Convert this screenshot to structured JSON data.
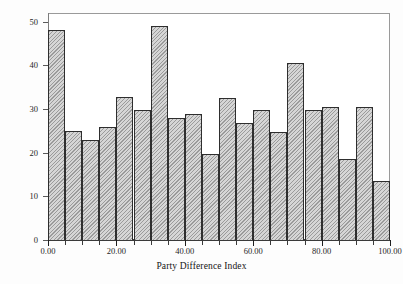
{
  "chart_data": {
    "type": "bar",
    "title": "",
    "subtitle": "",
    "xlabel": "Party Difference Index",
    "ylabel": "",
    "xlim": [
      0,
      100
    ],
    "ylim": [
      0,
      52
    ],
    "grid": false,
    "legend": null,
    "bin_width": 5,
    "x_ticks": [
      0,
      20,
      40,
      60,
      80,
      100
    ],
    "x_tick_labels": [
      "0.00",
      "20.00",
      "40.00",
      "60.00",
      "80.00",
      "100.00"
    ],
    "x_minor_ticks": [
      5,
      10,
      15,
      25,
      30,
      35,
      45,
      50,
      55,
      65,
      70,
      75,
      85,
      90,
      95
    ],
    "y_ticks": [
      0,
      10,
      20,
      30,
      40,
      50
    ],
    "y_tick_labels": [
      "0",
      "10",
      "20",
      "30",
      "40",
      "50"
    ],
    "categories": [
      "0-5",
      "5-10",
      "10-15",
      "15-20",
      "20-25",
      "25-30",
      "30-35",
      "35-40",
      "40-45",
      "45-50",
      "50-55",
      "55-60",
      "60-65",
      "65-70",
      "70-75",
      "75-80",
      "80-85",
      "85-90",
      "90-95",
      "95-100"
    ],
    "bin_starts": [
      0,
      5,
      10,
      15,
      20,
      25,
      30,
      35,
      40,
      45,
      50,
      55,
      60,
      65,
      70,
      75,
      80,
      85,
      90,
      95
    ],
    "values": [
      48,
      25,
      23,
      26,
      32.7,
      29.8,
      49,
      28,
      28.8,
      19.8,
      32.5,
      26.7,
      29.7,
      24.7,
      40.6,
      29.7,
      30.5,
      18.6,
      30.4,
      13.5
    ],
    "series": [
      {
        "name": "Party Difference Index frequency",
        "values": [
          48,
          25,
          23,
          26,
          32.7,
          29.8,
          49,
          28,
          28.8,
          19.8,
          32.5,
          26.7,
          29.7,
          24.7,
          40.6,
          29.7,
          30.5,
          18.6,
          30.4,
          13.5
        ]
      }
    ]
  },
  "style": {
    "bar_fill": "#d6d6d6",
    "bar_hatch_color": "#9b9b9b",
    "bar_edge": "#2e2e2e",
    "frame_color": "#9a9a9a",
    "axis_color": "#3a3a3a",
    "background": "#ffffff",
    "hatch_pattern": "diagonal-forward"
  }
}
